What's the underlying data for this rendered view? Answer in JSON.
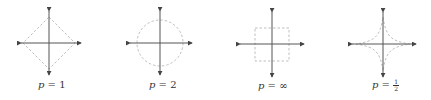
{
  "figures": [
    {
      "id": "p1",
      "p_symbol": "p",
      "equals": "=",
      "value": "1",
      "shape": "diamond",
      "center": [
        49,
        43
      ],
      "radius": 26
    },
    {
      "id": "p2",
      "p_symbol": "p",
      "equals": "=",
      "value": "2",
      "shape": "circle",
      "center": [
        160,
        43
      ],
      "radius": 23
    },
    {
      "id": "pinf",
      "p_symbol": "p",
      "equals": "=",
      "value": "∞",
      "shape": "square",
      "center": [
        272,
        44
      ],
      "radius": 17
    },
    {
      "id": "phalf",
      "p_symbol": "p",
      "equals": "=",
      "value_num": "1",
      "value_den": "2",
      "shape": "astroid",
      "center": [
        383,
        44
      ],
      "radius": 28
    }
  ],
  "colors": {
    "axis": "#555555",
    "dashed_shape": "#b8b8b8",
    "text": "#333333"
  }
}
